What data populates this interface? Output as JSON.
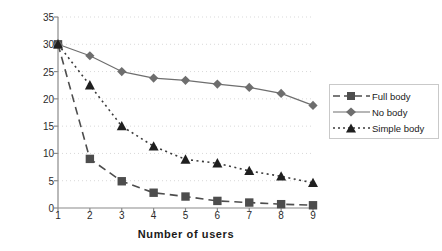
{
  "chart_data": {
    "type": "line",
    "title": "",
    "xlabel": "Number of users",
    "ylabel": "Frames/sec",
    "x": [
      1,
      2,
      3,
      4,
      5,
      6,
      7,
      8,
      9
    ],
    "xticklabels": [
      "1",
      "2",
      "3",
      "4",
      "5",
      "6",
      "7",
      "8",
      "9"
    ],
    "yticklabels": [
      "0",
      "5",
      "10",
      "15",
      "20",
      "25",
      "30",
      "35"
    ],
    "yticks": [
      0,
      5,
      10,
      15,
      20,
      25,
      30,
      35
    ],
    "xlim": [
      1,
      9
    ],
    "ylim": [
      0,
      35
    ],
    "grid": "horizontal-dotted",
    "legend_position": "right-outside",
    "series": [
      {
        "name": "Full body",
        "values": [
          30,
          9,
          4.9,
          2.8,
          2.1,
          1.3,
          1.0,
          0.7,
          0.5
        ],
        "marker": "square",
        "linestyle": "dashed",
        "color": "#4d4d4d"
      },
      {
        "name": "No body",
        "values": [
          30,
          27.9,
          25,
          23.8,
          23.4,
          22.7,
          22.1,
          21,
          18.8
        ],
        "marker": "diamond",
        "linestyle": "solid",
        "color": "#6e6e6e"
      },
      {
        "name": "Simple body",
        "values": [
          30,
          22.5,
          15,
          11.3,
          8.9,
          8.2,
          6.8,
          5.8,
          4.6
        ],
        "marker": "triangle",
        "linestyle": "dotted",
        "color": "#3a3a3a"
      }
    ]
  },
  "legend": {
    "entries": [
      {
        "label": "Full body"
      },
      {
        "label": "No body"
      },
      {
        "label": "Simple body"
      }
    ]
  },
  "colors": {
    "axis": "#8a8a8a",
    "grid": "#d9d9d9",
    "text": "#1a1a1a",
    "full_body": "#4d4d4d",
    "no_body": "#6e6e6e",
    "simple_body": "#3a3a3a"
  }
}
